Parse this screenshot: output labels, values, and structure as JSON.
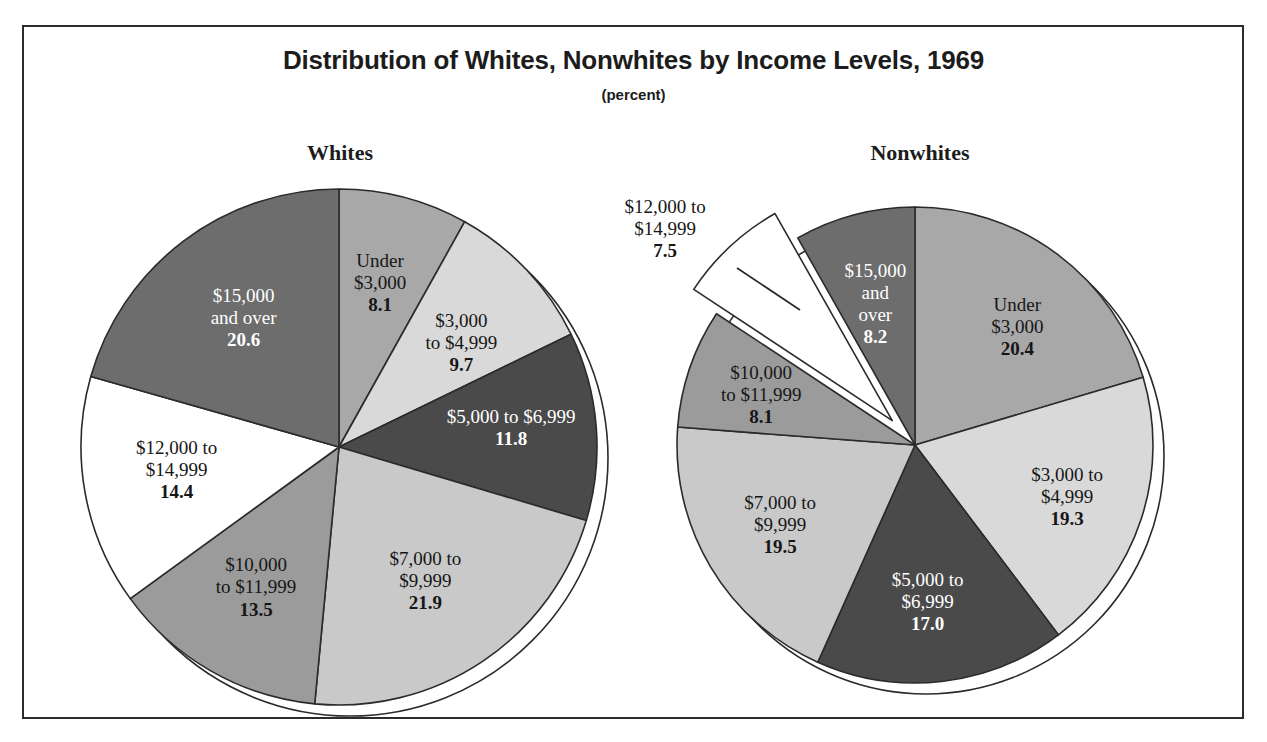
{
  "title": "Distribution of Whites, Nonwhites by Income Levels, 1969",
  "subtitle": "(percent)",
  "colors": {
    "background": "#ffffff",
    "frame_border": "#2b2b2b",
    "wedge_outline": "#2b2b2b",
    "text_dark": "#161616",
    "text_light": "#ffffff",
    "swatch_under_3000": "#a8a8a8",
    "swatch_3000_4999": "#d9d9d9",
    "swatch_5000_6999": "#4a4a4a",
    "swatch_7000_9999": "#c9c9c9",
    "swatch_10000_11999": "#9b9b9b",
    "swatch_12000_14999": "#ffffff",
    "swatch_15000_over": "#6d6d6d"
  },
  "chart_data": {
    "type": "pie",
    "title": "Distribution of Whites, Nonwhites by Income Levels, 1969",
    "subtitle": "(percent)",
    "unit": "percent",
    "categories": [
      "Under $3,000",
      "$3,000 to $4,999",
      "$5,000 to $6,999",
      "$7,000 to $9,999",
      "$10,000 to $11,999",
      "$12,000 to $14,999",
      "$15,000 and over"
    ],
    "series": [
      {
        "name": "Whites",
        "values": [
          8.1,
          9.7,
          11.8,
          21.9,
          13.5,
          14.4,
          20.6
        ]
      },
      {
        "name": "Nonwhites",
        "values": [
          20.4,
          19.3,
          17.0,
          19.5,
          8.1,
          7.5,
          8.2
        ]
      }
    ],
    "legend": "none",
    "grid": false
  },
  "pies": [
    {
      "heading": "Whites",
      "slices": [
        {
          "label_lines": [
            "Under",
            "$3,000"
          ],
          "value": "8.1",
          "value_num": 8.1,
          "fill": "#a8a8a8",
          "text": "dark",
          "exploded": false
        },
        {
          "label_lines": [
            "$3,000",
            "to $4,999"
          ],
          "value": "9.7",
          "value_num": 9.7,
          "fill": "#d9d9d9",
          "text": "dark",
          "exploded": false
        },
        {
          "label_lines": [
            "$5,000 to $6,999"
          ],
          "value": "11.8",
          "value_num": 11.8,
          "fill": "#4a4a4a",
          "text": "light",
          "exploded": false
        },
        {
          "label_lines": [
            "$7,000 to",
            "$9,999"
          ],
          "value": "21.9",
          "value_num": 21.9,
          "fill": "#c9c9c9",
          "text": "dark",
          "exploded": false
        },
        {
          "label_lines": [
            "$10,000",
            "to $11,999"
          ],
          "value": "13.5",
          "value_num": 13.5,
          "fill": "#9b9b9b",
          "text": "dark",
          "exploded": false
        },
        {
          "label_lines": [
            "$12,000 to",
            "$14,999"
          ],
          "value": "14.4",
          "value_num": 14.4,
          "fill": "#ffffff",
          "text": "dark",
          "exploded": false
        },
        {
          "label_lines": [
            "$15,000",
            "and over"
          ],
          "value": "20.6",
          "value_num": 20.6,
          "fill": "#6d6d6d",
          "text": "light",
          "exploded": false
        }
      ]
    },
    {
      "heading": "Nonwhites",
      "slices": [
        {
          "label_lines": [
            "Under",
            "$3,000"
          ],
          "value": "20.4",
          "value_num": 20.4,
          "fill": "#a8a8a8",
          "text": "dark",
          "exploded": false
        },
        {
          "label_lines": [
            "$3,000 to",
            "$4,999"
          ],
          "value": "19.3",
          "value_num": 19.3,
          "fill": "#d9d9d9",
          "text": "dark",
          "exploded": false
        },
        {
          "label_lines": [
            "$5,000 to",
            "$6,999"
          ],
          "value": "17.0",
          "value_num": 17.0,
          "fill": "#4a4a4a",
          "text": "light",
          "exploded": false
        },
        {
          "label_lines": [
            "$7,000 to",
            "$9,999"
          ],
          "value": "19.5",
          "value_num": 19.5,
          "fill": "#c9c9c9",
          "text": "dark",
          "exploded": false
        },
        {
          "label_lines": [
            "$10,000",
            "to $11,999"
          ],
          "value": "8.1",
          "value_num": 8.1,
          "fill": "#9b9b9b",
          "text": "dark",
          "exploded": false
        },
        {
          "label_lines": [
            "$12,000 to",
            "$14,999"
          ],
          "value": "7.5",
          "value_num": 7.5,
          "fill": "#ffffff",
          "text": "dark",
          "exploded": true
        },
        {
          "label_lines": [
            "$15,000",
            "and",
            "over"
          ],
          "value": "8.2",
          "value_num": 8.2,
          "fill": "#6d6d6d",
          "text": "light",
          "exploded": false
        }
      ]
    }
  ]
}
